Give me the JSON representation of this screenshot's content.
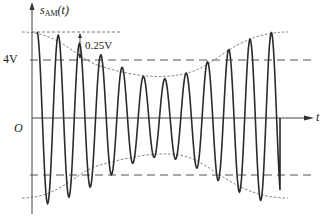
{
  "figure": {
    "y_axis_label": "s",
    "y_axis_subscript": "AM",
    "y_axis_arg": "(t)",
    "x_axis_label": "t",
    "origin_label": "O",
    "level_label": "4V",
    "delta_label": "0.25V",
    "colors": {
      "signal": "#2b2b2b",
      "axis": "#444444",
      "envelope": "#777777",
      "guide": "#555555"
    }
  },
  "signal": {
    "type": "amplitude-modulated carrier",
    "carrier_level_V": 4,
    "peak_deviation_V": 0.25,
    "visible_carrier_cycles": 13
  }
}
